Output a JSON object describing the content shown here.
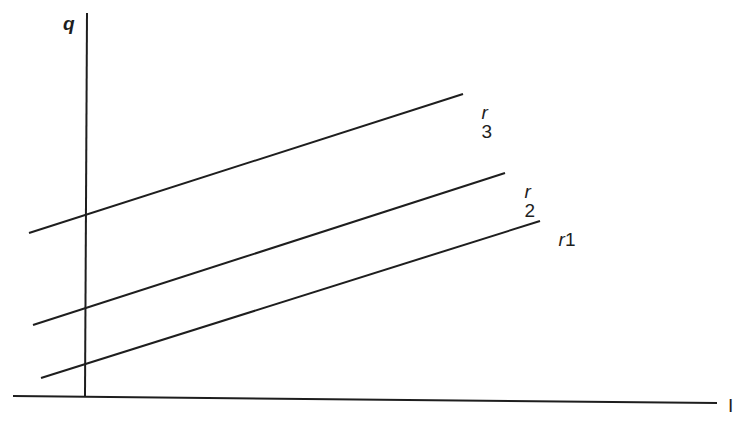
{
  "diagram": {
    "axes": {
      "y_label": "q",
      "x_label": "I"
    },
    "lines": [
      {
        "id": "r3",
        "var": "r",
        "index": "3",
        "x1": 29,
        "y1": 233,
        "x2": 463,
        "y2": 94
      },
      {
        "id": "r2",
        "var": "r",
        "index": "2",
        "x1": 33,
        "y1": 325,
        "x2": 505,
        "y2": 173
      },
      {
        "id": "r1",
        "var": "r",
        "index": "1",
        "x1": 41,
        "y1": 378,
        "x2": 540,
        "y2": 221
      }
    ],
    "colors": {
      "ink": "#1e1e1e",
      "background": "#ffffff"
    }
  }
}
